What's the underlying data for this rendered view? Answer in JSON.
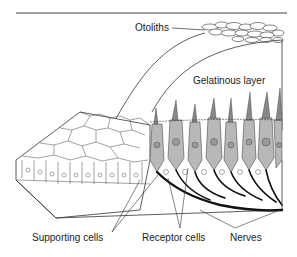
{
  "diagram": {
    "labels": {
      "otoliths": "Otoliths",
      "gelatinous_layer": "Gelatinous layer",
      "supporting_cells": "Supporting cells",
      "receptor_cells": "Receptor cells",
      "nerves": "Nerves"
    },
    "colors": {
      "line": "#222222",
      "receptor_fill": "#b8b8b8",
      "receptor_dark": "#8a8a8a",
      "nerve": "#111111",
      "background": "#ffffff"
    }
  }
}
